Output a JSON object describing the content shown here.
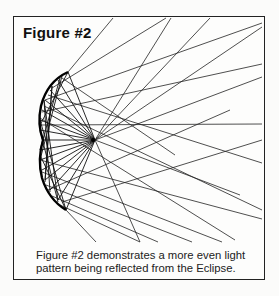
{
  "figure": {
    "title": "Figure #2",
    "caption_line1": "Figure #2 demonstrates a more even light",
    "caption_line2": "pattern being reflected from the Eclipse.",
    "colors": {
      "ink": "#111111",
      "background": "#fdfdfc"
    }
  }
}
